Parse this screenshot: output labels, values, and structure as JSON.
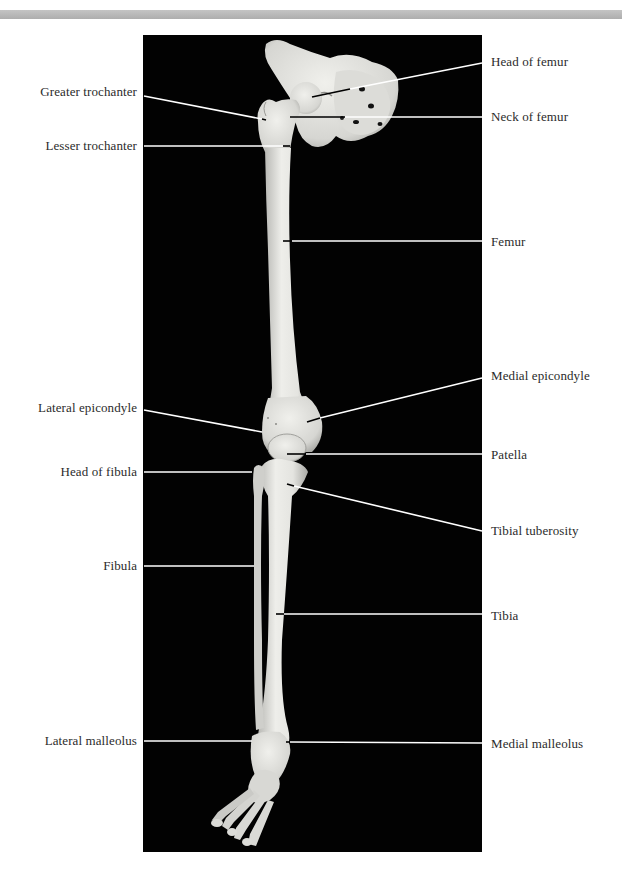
{
  "figure": {
    "background_color": "#020202",
    "bone_color": "#e6e6e2",
    "leader_color": "#ffffff",
    "label_color": "#2b2b2b"
  },
  "labels": {
    "left": [
      {
        "id": "greater-trochanter",
        "text": "Greater trochanter",
        "y": 84
      },
      {
        "id": "lesser-trochanter",
        "text": "Lesser trochanter",
        "y": 138
      },
      {
        "id": "lateral-epicondyle",
        "text": "Lateral epicondyle",
        "y": 400
      },
      {
        "id": "head-of-fibula",
        "text": "Head of fibula",
        "y": 464
      },
      {
        "id": "fibula",
        "text": "Fibula",
        "y": 558
      },
      {
        "id": "lateral-malleolus",
        "text": "Lateral malleolus",
        "y": 733
      }
    ],
    "right": [
      {
        "id": "head-of-femur",
        "text": "Head of femur",
        "y": 54
      },
      {
        "id": "neck-of-femur",
        "text": "Neck of femur",
        "y": 109
      },
      {
        "id": "femur",
        "text": "Femur",
        "y": 234
      },
      {
        "id": "medial-epicondyle",
        "text": "Medial epicondyle",
        "y": 368
      },
      {
        "id": "patella",
        "text": "Patella",
        "y": 447
      },
      {
        "id": "tibial-tuberosity",
        "text": "Tibial tuberosity",
        "y": 523
      },
      {
        "id": "tibia",
        "text": "Tibia",
        "y": 608
      },
      {
        "id": "medial-malleolus",
        "text": "Medial malleolus",
        "y": 736
      }
    ]
  }
}
